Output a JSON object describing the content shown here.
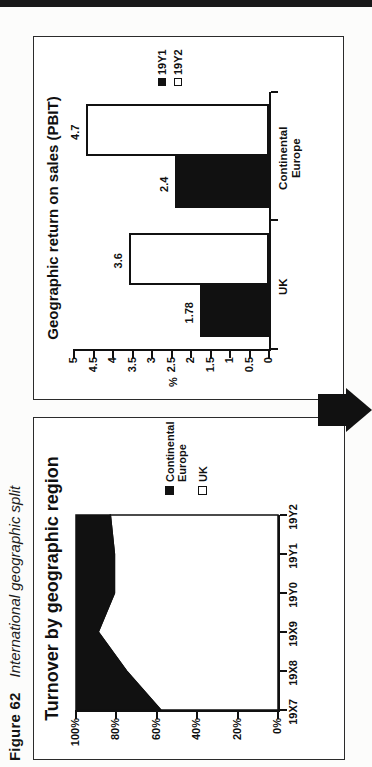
{
  "figure": {
    "label": "Figure 62",
    "title": "International geographic split"
  },
  "colors": {
    "series_dark": "#111111",
    "series_light": "#ffffff",
    "line": "#111111",
    "header_bar": "#191919"
  },
  "chart_data": [
    {
      "type": "area",
      "title": "Turnover by geographic region",
      "stacked_percent": true,
      "categories": [
        "19X7",
        "19X8",
        "19X9",
        "19Y0",
        "19Y1",
        "19Y2"
      ],
      "series": [
        {
          "name": "UK",
          "color": "#ffffff",
          "values": [
            58,
            75,
            89,
            81,
            81,
            83
          ]
        },
        {
          "name": "Continental Europe",
          "color": "#111111",
          "values": [
            42,
            25,
            11,
            19,
            19,
            17
          ]
        }
      ],
      "yticks": [
        "100%",
        "80%",
        "60%",
        "40%",
        "20%",
        "0%"
      ],
      "ylim": [
        0,
        100
      ],
      "grid": false,
      "legend_position": "right",
      "legend": [
        {
          "lines": [
            "Continental",
            "Europe"
          ],
          "fill": "#111111"
        },
        {
          "lines": [
            "UK"
          ],
          "fill": "#ffffff"
        }
      ]
    },
    {
      "type": "bar",
      "title": "Geographic return on sales (PBIT)",
      "ylabel": "%",
      "categories": [
        "UK",
        "Continental Europe"
      ],
      "category_lines": [
        [
          "UK"
        ],
        [
          "Continental",
          "Europe"
        ]
      ],
      "series": [
        {
          "name": "19Y1",
          "fill": "#111111",
          "values": [
            1.78,
            2.4
          ],
          "labels": [
            "1.78",
            "2.4"
          ]
        },
        {
          "name": "19Y2",
          "fill": "#ffffff",
          "values": [
            3.6,
            4.7
          ],
          "labels": [
            "3.6",
            "4.7"
          ]
        }
      ],
      "yticks": [
        "5",
        "4.5",
        "4",
        "3.5",
        "3",
        "2.5",
        "2",
        "1.5",
        "1",
        "0.5",
        "0"
      ],
      "ylim": [
        0,
        5
      ],
      "ytick_step": 0.5,
      "grid": false,
      "legend_position": "right",
      "legend": [
        {
          "label": "19Y1",
          "fill": "#111111"
        },
        {
          "label": "19Y2",
          "fill": "#ffffff"
        }
      ]
    }
  ]
}
